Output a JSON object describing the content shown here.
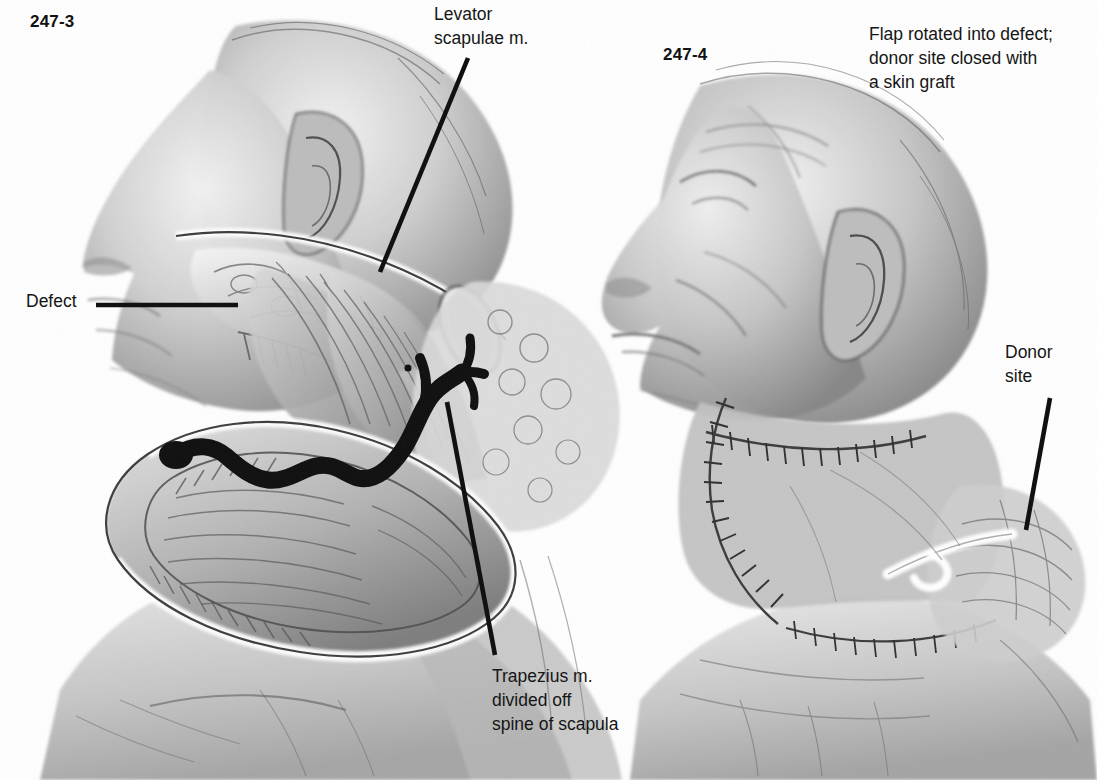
{
  "page": {
    "width": 1097,
    "height": 780,
    "background": "#ffffff",
    "ink": "#151515",
    "medium": "graphite / halftone medical illustration"
  },
  "figures": {
    "left": {
      "number": "247-3",
      "subject": "Lateral view of head and neck with trapezius myocutaneous flap elevated; surgical defect exposed",
      "orientation": "profile facing left"
    },
    "right": {
      "number": "247-4",
      "subject": "Lateral view of head and neck after flap inset; sutured incisions and neck drain visible",
      "orientation": "profile facing left"
    }
  },
  "labels": {
    "levator": "Levator\nscapulae m.",
    "defect": "Defect",
    "trapezius": "Trapezius m.\ndivided off\nspine of scapula",
    "donor": "Donor\nsite",
    "caption_right": "Flap rotated into defect;\ndonor site closed with\na skin graft"
  },
  "leader_lines": [
    {
      "name": "levator-leader",
      "x1": 468,
      "y1": 58,
      "x2": 380,
      "y2": 272
    },
    {
      "name": "defect-leader",
      "x1": 96,
      "y1": 305,
      "x2": 238,
      "y2": 305
    },
    {
      "name": "trapezius-leader",
      "x1": 447,
      "y1": 402,
      "x2": 495,
      "y2": 655
    },
    {
      "name": "donor-leader",
      "x1": 1050,
      "y1": 398,
      "x2": 1026,
      "y2": 530
    }
  ],
  "annotations": {
    "pedicle": "black tortuous vascular pedicle with branches running across elevated flap",
    "drain": "white neck drain tube at lower right of figure 247-4",
    "sutures": "ladder-rung stitch marks along closed incision lines"
  }
}
